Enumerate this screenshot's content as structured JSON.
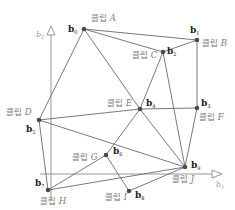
{
  "diagram": {
    "type": "graph-embedding",
    "axes": {
      "vertical": {
        "label": "b",
        "subscript": "2"
      },
      "horizontal": {
        "label": "b",
        "subscript": "1"
      }
    },
    "nodes": [
      {
        "id": "b0",
        "vector": "b",
        "index": "0",
        "clip_prefix": "클립",
        "clip_letter": "A",
        "x": 84,
        "y": 29
      },
      {
        "id": "b1",
        "vector": "b",
        "index": "1",
        "clip_prefix": "클립",
        "clip_letter": "B",
        "x": 197,
        "y": 40
      },
      {
        "id": "b2",
        "vector": "b",
        "index": "2",
        "clip_prefix": "클립",
        "clip_letter": "C",
        "x": 163,
        "y": 52
      },
      {
        "id": "b3",
        "vector": "b",
        "index": "3",
        "clip_prefix": "클립",
        "clip_letter": "F",
        "x": 197,
        "y": 108
      },
      {
        "id": "b4",
        "vector": "b",
        "index": "4",
        "clip_prefix": "클립",
        "clip_letter": "E",
        "x": 140,
        "y": 109
      },
      {
        "id": "b5",
        "vector": "b",
        "index": "5",
        "clip_prefix": "클립",
        "clip_letter": "D",
        "x": 39,
        "y": 120
      },
      {
        "id": "b6",
        "vector": "b",
        "index": "6",
        "clip_prefix": "클립",
        "clip_letter": "G",
        "x": 106,
        "y": 155
      },
      {
        "id": "b7",
        "vector": "b",
        "index": "7",
        "clip_prefix": "클립",
        "clip_letter": "H",
        "x": 48,
        "y": 190
      },
      {
        "id": "b8",
        "vector": "b",
        "index": "8",
        "clip_prefix": "클립",
        "clip_letter": "I",
        "x": 129,
        "y": 191
      },
      {
        "id": "b9",
        "vector": "b",
        "index": "9",
        "clip_prefix": "클립",
        "clip_letter": "J",
        "x": 185,
        "y": 167
      }
    ],
    "edges": [
      [
        "b0",
        "b1"
      ],
      [
        "b0",
        "b2"
      ],
      [
        "b0",
        "b4"
      ],
      [
        "b0",
        "b5"
      ],
      [
        "b1",
        "b2"
      ],
      [
        "b1",
        "b3"
      ],
      [
        "b2",
        "b4"
      ],
      [
        "b2",
        "b9"
      ],
      [
        "b3",
        "b4"
      ],
      [
        "b3",
        "b9"
      ],
      [
        "b4",
        "b5"
      ],
      [
        "b4",
        "b6"
      ],
      [
        "b4",
        "b9"
      ],
      [
        "b5",
        "b7"
      ],
      [
        "b5",
        "b9"
      ],
      [
        "b6",
        "b7"
      ],
      [
        "b6",
        "b8"
      ],
      [
        "b7",
        "b9"
      ],
      [
        "b8",
        "b9"
      ]
    ]
  }
}
